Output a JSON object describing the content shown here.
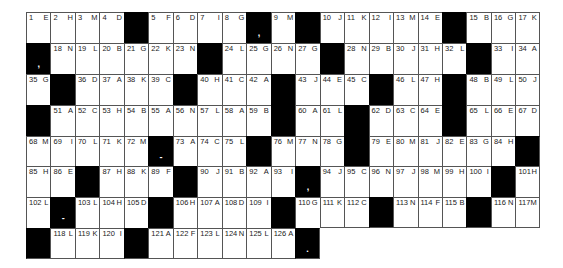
{
  "puzzle": {
    "type": "acrostic-grid",
    "columns": 21,
    "rows": [
      [
        [
          "1",
          "E"
        ],
        [
          "2",
          "H"
        ],
        [
          "3",
          "M"
        ],
        [
          "4",
          "D"
        ],
        [
          "#",
          ""
        ],
        [
          "5",
          "F"
        ],
        [
          "6",
          "D"
        ],
        [
          "7",
          "I"
        ],
        [
          "8",
          "G"
        ],
        [
          "#",
          ","
        ],
        [
          "9",
          "M"
        ],
        [
          "#",
          ""
        ],
        [
          "10",
          "J"
        ],
        [
          "11",
          "K"
        ],
        [
          "12",
          "I"
        ],
        [
          "13",
          "M"
        ],
        [
          "14",
          "E"
        ],
        [
          "#",
          ""
        ],
        [
          "15",
          "B"
        ],
        [
          "16",
          "G"
        ],
        [
          "17",
          "K"
        ]
      ],
      [
        [
          "#",
          ","
        ],
        [
          "18",
          "N"
        ],
        [
          "19",
          "L"
        ],
        [
          "20",
          "B"
        ],
        [
          "21",
          "G"
        ],
        [
          "22",
          "K"
        ],
        [
          "23",
          "N"
        ],
        [
          "#",
          ""
        ],
        [
          "24",
          "L"
        ],
        [
          "25",
          "G"
        ],
        [
          "26",
          "N"
        ],
        [
          "27",
          "G"
        ],
        [
          "#",
          ""
        ],
        [
          "28",
          "N"
        ],
        [
          "29",
          "B"
        ],
        [
          "30",
          "J"
        ],
        [
          "31",
          "H"
        ],
        [
          "32",
          "L"
        ],
        [
          "#",
          ""
        ],
        [
          "33",
          "I"
        ],
        [
          "34",
          "A"
        ]
      ],
      [
        [
          "35",
          "G"
        ],
        [
          "#",
          ""
        ],
        [
          "36",
          "D"
        ],
        [
          "37",
          "A"
        ],
        [
          "38",
          "K"
        ],
        [
          "39",
          "C"
        ],
        [
          "#",
          ""
        ],
        [
          "40",
          "H"
        ],
        [
          "41",
          "C"
        ],
        [
          "42",
          "A"
        ],
        [
          "#",
          ""
        ],
        [
          "43",
          "J"
        ],
        [
          "44",
          "E"
        ],
        [
          "45",
          "C"
        ],
        [
          "#",
          ""
        ],
        [
          "46",
          "L"
        ],
        [
          "47",
          "H"
        ],
        [
          "#",
          ""
        ],
        [
          "48",
          "B"
        ],
        [
          "49",
          "L"
        ],
        [
          "50",
          "J"
        ]
      ],
      [
        [
          "#",
          ""
        ],
        [
          "51",
          "A"
        ],
        [
          "52",
          "C"
        ],
        [
          "53",
          "H"
        ],
        [
          "54",
          "B"
        ],
        [
          "55",
          "A"
        ],
        [
          "56",
          "N"
        ],
        [
          "57",
          "L"
        ],
        [
          "58",
          "A"
        ],
        [
          "59",
          "B"
        ],
        [
          "#",
          ""
        ],
        [
          "60",
          "A"
        ],
        [
          "61",
          "L"
        ],
        [
          "#",
          ""
        ],
        [
          "62",
          "D"
        ],
        [
          "63",
          "C"
        ],
        [
          "64",
          "E"
        ],
        [
          "#",
          ""
        ],
        [
          "65",
          "L"
        ],
        [
          "66",
          "E"
        ],
        [
          "67",
          "D"
        ]
      ],
      [
        [
          "68",
          "M"
        ],
        [
          "69",
          "I"
        ],
        [
          "70",
          "L"
        ],
        [
          "71",
          "K"
        ],
        [
          "72",
          "M"
        ],
        [
          "#",
          "-"
        ],
        [
          "73",
          "A"
        ],
        [
          "74",
          "C"
        ],
        [
          "75",
          "L"
        ],
        [
          "#",
          ""
        ],
        [
          "76",
          "M"
        ],
        [
          "77",
          "N"
        ],
        [
          "78",
          "G"
        ],
        [
          "#",
          ""
        ],
        [
          "79",
          "E"
        ],
        [
          "80",
          "M"
        ],
        [
          "81",
          "J"
        ],
        [
          "82",
          "E"
        ],
        [
          "83",
          "G"
        ],
        [
          "84",
          "H"
        ],
        [
          "#",
          ""
        ]
      ],
      [
        [
          "85",
          "H"
        ],
        [
          "86",
          "E"
        ],
        [
          "#",
          ""
        ],
        [
          "87",
          "H"
        ],
        [
          "88",
          "K"
        ],
        [
          "89",
          "F"
        ],
        [
          "#",
          ""
        ],
        [
          "90",
          "J"
        ],
        [
          "91",
          "B"
        ],
        [
          "92",
          "A"
        ],
        [
          "93",
          "I"
        ],
        [
          "#",
          ","
        ],
        [
          "94",
          "J"
        ],
        [
          "95",
          "C"
        ],
        [
          "96",
          "N"
        ],
        [
          "97",
          "J"
        ],
        [
          "98",
          "M"
        ],
        [
          "99",
          "H"
        ],
        [
          "100",
          "I"
        ],
        [
          "#",
          ""
        ],
        [
          "101",
          "H"
        ]
      ],
      [
        [
          "102",
          "L"
        ],
        [
          "#",
          "-"
        ],
        [
          "103",
          "L"
        ],
        [
          "104",
          "H"
        ],
        [
          "105",
          "D"
        ],
        [
          "#",
          ""
        ],
        [
          "106",
          "H"
        ],
        [
          "107",
          "A"
        ],
        [
          "108",
          "D"
        ],
        [
          "109",
          "I"
        ],
        [
          "#",
          ""
        ],
        [
          "110",
          "G"
        ],
        [
          "111",
          "K"
        ],
        [
          "112",
          "C"
        ],
        [
          "#",
          ""
        ],
        [
          "113",
          "N"
        ],
        [
          "114",
          "F"
        ],
        [
          "115",
          "B"
        ],
        [
          "#",
          ""
        ],
        [
          "116",
          "N"
        ],
        [
          "117",
          "M"
        ]
      ],
      [
        [
          "#",
          ""
        ],
        [
          "118",
          "L"
        ],
        [
          "119",
          "K"
        ],
        [
          "120",
          "I"
        ],
        [
          "#",
          ""
        ],
        [
          "121",
          "A"
        ],
        [
          "122",
          "F"
        ],
        [
          "123",
          "L"
        ],
        [
          "124",
          "N"
        ],
        [
          "125",
          "L"
        ],
        [
          "126",
          "A"
        ],
        [
          "#",
          "."
        ]
      ]
    ]
  }
}
